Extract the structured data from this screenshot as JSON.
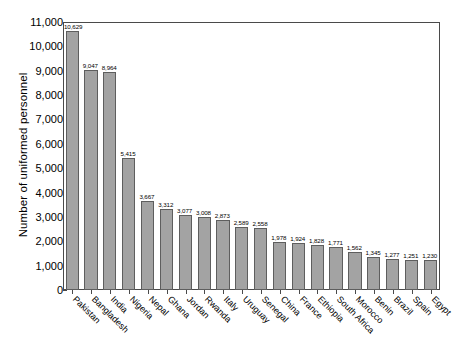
{
  "chart_data": {
    "type": "bar",
    "title": "",
    "xlabel": "",
    "ylabel": "Number of uniformed personnel",
    "ylim": [
      0,
      11000
    ],
    "grid": false,
    "legend": null,
    "y_ticks": [
      "0",
      "1,000",
      "2,000",
      "3,000",
      "4,000",
      "5,000",
      "6,000",
      "7,000",
      "8,000",
      "9,000",
      "10,000",
      "11,000"
    ],
    "y_tick_values": [
      0,
      1000,
      2000,
      3000,
      4000,
      5000,
      6000,
      7000,
      8000,
      9000,
      10000,
      11000
    ],
    "categories": [
      "Pakistan",
      "Bangladesh",
      "India",
      "Nigeria",
      "Nepal",
      "Ghana",
      "Jordan",
      "Rwanda",
      "Italy",
      "Uruguay",
      "Senegal",
      "China",
      "France",
      "Ethiopia",
      "South Africa",
      "Morocco",
      "Benin",
      "Brazil",
      "Spain",
      "Egypt"
    ],
    "values": [
      10629,
      9047,
      8964,
      5415,
      3667,
      3312,
      3077,
      3008,
      2873,
      2589,
      2558,
      1978,
      1924,
      1828,
      1771,
      1562,
      1345,
      1277,
      1251,
      1230
    ],
    "value_labels": [
      "10,629",
      "9,047",
      "8,964",
      "5,415",
      "3,667",
      "3,312",
      "3,077",
      "3,008",
      "2,873",
      "2,589",
      "2,558",
      "1,978",
      "1,924",
      "1,828",
      "1,771",
      "1,562",
      "1,345",
      "1,277",
      "1,251",
      "1,230"
    ],
    "colors": {
      "bar_fill": "#a3a3a3",
      "bar_stroke": "#5e5e5e",
      "axis": "#4a4a4a",
      "text": "#000000",
      "background": "#ffffff"
    }
  }
}
